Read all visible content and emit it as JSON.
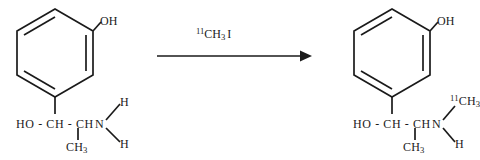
{
  "scheme": {
    "type": "chemical-reaction",
    "description": "Radiosynthesis of N-[11C]methyl metaraminol from metaraminol and [11C]methyl iodide",
    "reactant": {
      "name": "metaraminol",
      "ring_substituent": "OH",
      "chain": "HO - CH - CH",
      "nitrogen": "N",
      "methyl_branch": "CH",
      "methyl_branch_sub": "3",
      "amine_h_top": "H",
      "amine_h_bottom": "H"
    },
    "arrow": {
      "reagent_superscript": "11",
      "reagent_main": "CH",
      "reagent_sub": "3",
      "reagent_tail": "I",
      "direction": "right"
    },
    "product": {
      "name": "N-[11C]methyl metaraminol",
      "ring_substituent": "OH",
      "chain": "HO - CH - CH",
      "nitrogen": "N",
      "methyl_branch": "CH",
      "methyl_branch_sub": "3",
      "n_methyl_superscript": "11",
      "n_methyl_main": "CH",
      "n_methyl_sub": "3",
      "amine_h": "H"
    },
    "colors": {
      "bond": "#1a1a1a",
      "text": "#1a1a1a",
      "background": "#ffffff"
    }
  }
}
